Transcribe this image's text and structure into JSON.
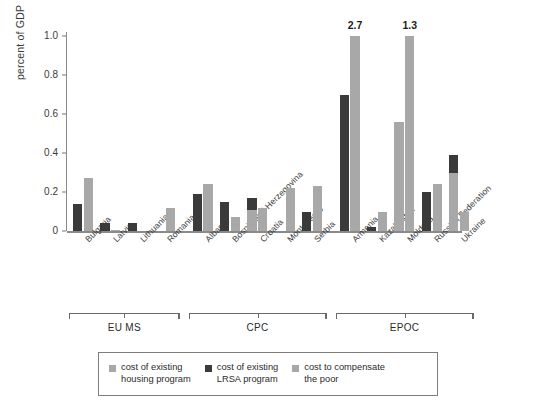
{
  "chart_data": {
    "type": "bar",
    "title": "",
    "xlabel": "",
    "ylabel": "percent of GDP",
    "ylim": [
      0,
      1.0
    ],
    "yticks": [
      "0",
      "0.2",
      "0.4",
      "0.6",
      "0.8",
      "1.0"
    ],
    "ytick_values": [
      0,
      0.2,
      0.4,
      0.6,
      0.8,
      1.0
    ],
    "grid": false,
    "legend_position": "bottom",
    "categories": [
      "Bulgaria",
      "Latvia",
      "Lithuania",
      "Romania",
      "Albania",
      "Bosnia and Herzegovina",
      "Croatia",
      "Montenegro",
      "Serbia",
      "Armenia",
      "Kazakhstan",
      "Moldova",
      "Russian Federation",
      "Ukraine"
    ],
    "series": [
      {
        "name": "cost of existing housing program",
        "color": "#a8a8a8",
        "values": [
          0.14,
          0.0,
          0.0,
          0.0,
          0.0,
          0.0,
          0.11,
          0.0,
          0.0,
          0.0,
          0.0,
          0.56,
          0.0,
          0.3
        ]
      },
      {
        "name": "cost of existing LRSA program",
        "color": "#3a3a3a",
        "values": [
          0.14,
          0.04,
          0.04,
          0.0,
          0.19,
          0.15,
          0.17,
          0.0,
          0.1,
          0.7,
          0.02,
          0.0,
          0.2,
          0.39
        ]
      },
      {
        "name": "cost to compensate the poor",
        "color": "#a8a8a8",
        "values": [
          0.27,
          0.005,
          0.0,
          0.12,
          0.24,
          0.07,
          0.12,
          0.22,
          0.23,
          1.0,
          0.1,
          1.0,
          0.24,
          0.1
        ]
      }
    ],
    "capped_labels": [
      {
        "category": "Armenia",
        "series": "cost to compensate the poor",
        "label": "2.7",
        "actual": 2.7
      },
      {
        "category": "Moldova",
        "series": "cost to compensate the poor",
        "label": "1.3",
        "actual": 1.3
      }
    ],
    "groups": [
      {
        "label": "EU MS",
        "members": [
          "Bulgaria",
          "Latvia",
          "Lithuania",
          "Romania"
        ]
      },
      {
        "label": "CPC",
        "members": [
          "Albania",
          "Bosnia and Herzegovina",
          "Croatia",
          "Montenegro",
          "Serbia"
        ]
      },
      {
        "label": "EPOC",
        "members": [
          "Armenia",
          "Kazakhstan",
          "Moldova",
          "Russian Federation",
          "Ukraine"
        ]
      }
    ]
  },
  "legend": {
    "items": [
      {
        "label": "cost of existing\nhousing program",
        "color": "#a8a8a8",
        "swatch": "square-swatch"
      },
      {
        "label": "cost of existing\nLRSA program",
        "color": "#3a3a3a",
        "swatch": "square-swatch"
      },
      {
        "label": "cost to compensate\nthe poor",
        "color": "#a8a8a8",
        "swatch": "square-swatch"
      }
    ]
  },
  "colors": {
    "housing": "#a8a8a8",
    "lrsa": "#3a3a3a",
    "compensate": "#a8a8a8",
    "axis": "#8a8a8a",
    "text": "#2b2b2b"
  }
}
